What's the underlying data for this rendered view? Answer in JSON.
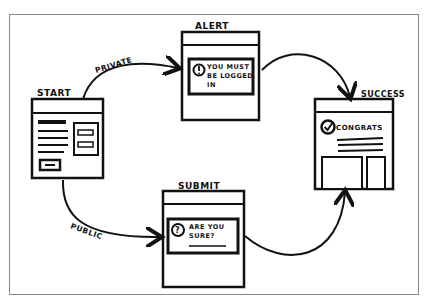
{
  "diagram": {
    "type": "hand-drawn wireframe user flow",
    "screens": {
      "start": {
        "label": "START"
      },
      "alert": {
        "label": "ALERT",
        "message_line1": "YOU MUST",
        "message_line2": "BE LOGGED",
        "message_line3": "IN",
        "icon": "exclamation-circle-icon"
      },
      "submit": {
        "label": "SUBMIT",
        "message_line1": "ARE YOU",
        "message_line2": "SURE?",
        "icon": "question-circle-icon"
      },
      "success": {
        "label": "SUCCESS",
        "message": "CONGRATS",
        "icon": "check-circle-icon"
      }
    },
    "edges": [
      {
        "from": "start",
        "to": "alert",
        "label": "PRIVATE"
      },
      {
        "from": "start",
        "to": "submit",
        "label": "PUBLIC"
      },
      {
        "from": "alert",
        "to": "success",
        "label": ""
      },
      {
        "from": "submit",
        "to": "success",
        "label": ""
      }
    ],
    "colors": {
      "ink": "#111111",
      "frame": "#8a8a8a",
      "background": "#ffffff"
    }
  }
}
